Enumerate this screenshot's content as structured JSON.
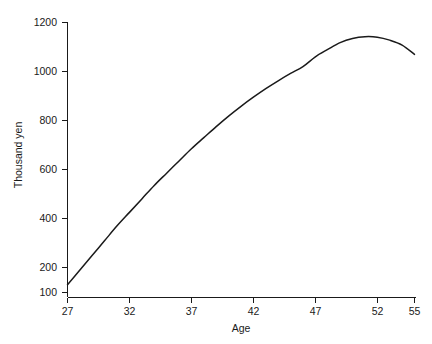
{
  "chart_data": {
    "type": "line",
    "title": "",
    "subtitle": "",
    "xlabel": "Age",
    "ylabel": "Thousand yen",
    "xlim": [
      27,
      55
    ],
    "ylim": [
      100,
      1200
    ],
    "grid": false,
    "legend": null,
    "xticks": [
      27,
      32,
      37,
      42,
      47,
      52,
      55
    ],
    "xtick_labels": [
      "27",
      "32",
      "37",
      "42",
      "47",
      "52",
      "55"
    ],
    "yticks": [
      100,
      200,
      400,
      600,
      800,
      1000,
      1200
    ],
    "ytick_labels": [
      "100",
      "200",
      "400",
      "600",
      "800",
      "1000",
      "1200"
    ],
    "series": [
      {
        "name": "Age-earnings profile",
        "color": "#1a1a1a",
        "x": [
          27,
          28,
          29,
          30,
          31,
          32,
          33,
          34,
          35,
          36,
          37,
          38,
          39,
          40,
          41,
          42,
          43,
          44,
          45,
          46,
          47,
          48,
          49,
          50,
          51,
          52,
          53,
          54,
          55
        ],
        "values": [
          130,
          190,
          250,
          310,
          370,
          425,
          480,
          535,
          585,
          635,
          685,
          730,
          775,
          818,
          858,
          895,
          930,
          962,
          992,
          1020,
          1060,
          1090,
          1118,
          1135,
          1142,
          1140,
          1128,
          1108,
          1070
        ]
      }
    ]
  },
  "axes": {
    "y_axis_label": "Thousand yen",
    "x_axis_label": "Age"
  }
}
